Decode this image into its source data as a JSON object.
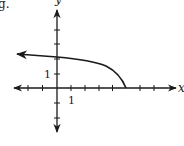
{
  "problem_label": "g.",
  "axes": {
    "x_label": "x",
    "y_label": "y",
    "x_unit_label": "1",
    "y_unit_label": "1",
    "x_ticks": [
      -4,
      -3,
      -2,
      -1,
      1,
      2,
      3,
      4,
      5,
      6,
      7
    ],
    "y_ticks": [
      -2,
      -1,
      1,
      2,
      3,
      4
    ]
  },
  "curve": {
    "description": "Curve starting at endpoint (5, 0), rising to the left through about (0, 2.2), continuing left with an arrow near (-3, 2.4)",
    "endpoint": [
      5,
      0
    ],
    "direction": "left",
    "color": "#1a1a1a"
  },
  "colors": {
    "ink": "#1a1a1a",
    "background": "#ffffff"
  }
}
